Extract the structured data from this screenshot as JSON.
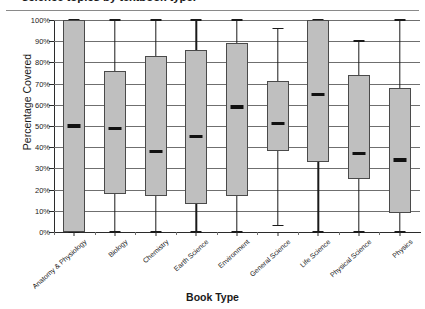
{
  "chart_data": {
    "type": "box",
    "title": "science topics by textbook type.",
    "xlabel": "Book Type",
    "ylabel": "Percentage Covered",
    "ylim": [
      0,
      100
    ],
    "ytick_labels": [
      "100%",
      "90%",
      "80%",
      "70%",
      "60%",
      "50%",
      "40%",
      "30%",
      "20%",
      "10%",
      "0%"
    ],
    "ytick_values": [
      100,
      90,
      80,
      70,
      60,
      50,
      40,
      30,
      20,
      10,
      0
    ],
    "grid": true,
    "legend": "none",
    "categories": [
      "Anatomy & Physiology",
      "Biology",
      "Chemistry",
      "Earth Science",
      "Environment",
      "General Science",
      "Life Science",
      "Physical Science",
      "Physics"
    ],
    "boxes": [
      {
        "category": "Anatomy & Physiology",
        "whisker_low": 0,
        "q1": 0,
        "median": 50,
        "q3": 100,
        "whisker_high": 100
      },
      {
        "category": "Biology",
        "whisker_low": 0,
        "q1": 18,
        "median": 49,
        "q3": 76,
        "whisker_high": 100
      },
      {
        "category": "Chemistry",
        "whisker_low": 0,
        "q1": 17,
        "median": 38,
        "q3": 83,
        "whisker_high": 100
      },
      {
        "category": "Earth Science",
        "whisker_low": 0,
        "q1": 13,
        "median": 45,
        "q3": 86,
        "whisker_high": 100
      },
      {
        "category": "Environment",
        "whisker_low": 0,
        "q1": 17,
        "median": 59,
        "q3": 89,
        "whisker_high": 100
      },
      {
        "category": "General Science",
        "whisker_low": 3,
        "q1": 38,
        "median": 51,
        "q3": 71,
        "whisker_high": 96
      },
      {
        "category": "Life Science",
        "whisker_low": 0,
        "q1": 33,
        "median": 65,
        "q3": 100,
        "whisker_high": 100
      },
      {
        "category": "Physical Science",
        "whisker_low": 0,
        "q1": 25,
        "median": 37,
        "q3": 74,
        "whisker_high": 90
      },
      {
        "category": "Physics",
        "whisker_low": 0,
        "q1": 9,
        "median": 34,
        "q3": 68,
        "whisker_high": 100
      }
    ],
    "colors": {
      "box_fill": "#bfbfbf",
      "box_edge": "#4a4a4a",
      "median": "#111111",
      "whisker": "#1a1a1a",
      "grid": "#6f6f6f",
      "axis": "#2b2b2b",
      "text": "#1a1a1a",
      "background": "#ffffff"
    }
  }
}
